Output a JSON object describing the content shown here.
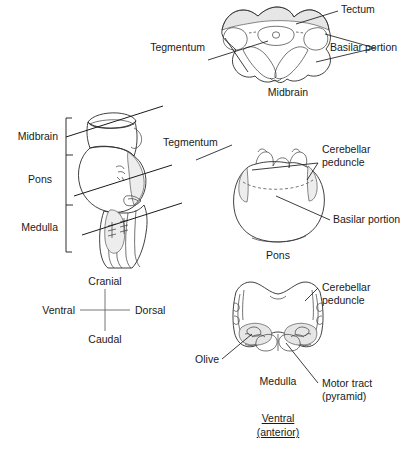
{
  "figure": {
    "ink_color": "#1a1a1a",
    "shade_color": "#e6e6e6"
  },
  "midbrain_panel": {
    "caption": "Midbrain",
    "labels": {
      "tectum": "Tectum",
      "basilar_portion": "Basilar portion",
      "tegmentum": "Tegmentum"
    }
  },
  "pons_panel": {
    "caption": "Pons",
    "labels": {
      "cerebellar_peduncle": "Cerebellar peduncle",
      "basilar_portion": "Basilar portion"
    }
  },
  "medulla_panel": {
    "caption": "Medulla",
    "labels": {
      "cerebellar_peduncle": "Cerebellar peduncle",
      "olive": "Olive",
      "motor_tract": "Motor tract (pyramid)"
    },
    "orientation_caption": {
      "line1": "Ventral",
      "line2": "(anterior)"
    }
  },
  "sagittal_panel": {
    "region_labels": [
      "Midbrain",
      "Pons",
      "Medulla"
    ],
    "tegmentum_label": "Tegmentum"
  },
  "compass": {
    "cranial": "Cranial",
    "caudal": "Caudal",
    "ventral": "Ventral",
    "dorsal": "Dorsal"
  }
}
